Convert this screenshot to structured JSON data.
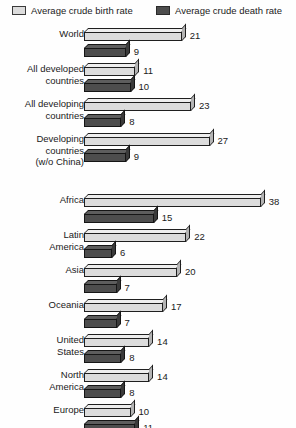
{
  "legend": {
    "birth": {
      "label": "Average crude birth rate",
      "swatch": "light-swatch-icon",
      "color": "#dcdcdc"
    },
    "death": {
      "label": "Average crude death rate",
      "swatch": "dark-swatch-icon",
      "color": "#4d4d4d"
    }
  },
  "chart_data": {
    "type": "bar",
    "orientation": "horizontal",
    "title": "",
    "subtitle": "",
    "xlabel": "",
    "ylabel": "",
    "xlim": [
      0,
      38
    ],
    "grid": false,
    "legend_position": "top",
    "categories": [
      "World",
      "All developed countries",
      "All developing countries",
      "Developing countries (w/o China)",
      "Africa",
      "Latin America",
      "Asia",
      "Oceania",
      "United States",
      "North America",
      "Europe"
    ],
    "series": [
      {
        "name": "Average crude birth rate",
        "values": [
          21,
          11,
          23,
          27,
          38,
          22,
          20,
          17,
          14,
          14,
          10
        ]
      },
      {
        "name": "Average crude death rate",
        "values": [
          9,
          10,
          8,
          9,
          15,
          6,
          7,
          7,
          8,
          8,
          11
        ]
      }
    ]
  },
  "groups": [
    {
      "label_lines": [
        "World"
      ],
      "birth": 21,
      "death": 9,
      "birth_text": "21",
      "death_text": "9"
    },
    {
      "label_lines": [
        "All developed",
        "countries"
      ],
      "birth": 11,
      "death": 10,
      "birth_text": "11",
      "death_text": "10"
    },
    {
      "label_lines": [
        "All developing",
        "countries"
      ],
      "birth": 23,
      "death": 8,
      "birth_text": "23",
      "death_text": "8"
    },
    {
      "label_lines": [
        "Developing",
        "countries",
        "(w/o China)"
      ],
      "birth": 27,
      "death": 9,
      "birth_text": "27",
      "death_text": "9"
    },
    {
      "label_lines": [
        "Africa"
      ],
      "birth": 38,
      "death": 15,
      "birth_text": "38",
      "death_text": "15"
    },
    {
      "label_lines": [
        "Latin",
        "America"
      ],
      "birth": 22,
      "death": 6,
      "birth_text": "22",
      "death_text": "6"
    },
    {
      "label_lines": [
        "Asia"
      ],
      "birth": 20,
      "death": 7,
      "birth_text": "20",
      "death_text": "7"
    },
    {
      "label_lines": [
        "Oceania"
      ],
      "birth": 17,
      "death": 7,
      "birth_text": "17",
      "death_text": "7"
    },
    {
      "label_lines": [
        "United",
        "States"
      ],
      "birth": 14,
      "death": 8,
      "birth_text": "14",
      "death_text": "8"
    },
    {
      "label_lines": [
        "North",
        "America"
      ],
      "birth": 14,
      "death": 8,
      "birth_text": "14",
      "death_text": "8"
    },
    {
      "label_lines": [
        "Europe"
      ],
      "birth": 10,
      "death": 11,
      "birth_text": "10",
      "death_text": "11"
    }
  ],
  "layout": {
    "unit_px": 4.65,
    "group_tops": [
      2,
      37,
      72,
      107,
      168,
      203,
      238,
      273,
      308,
      343,
      378
    ],
    "group_label_tops": [
      2,
      37,
      72,
      107,
      168,
      203,
      238,
      273,
      308,
      343,
      378
    ]
  }
}
